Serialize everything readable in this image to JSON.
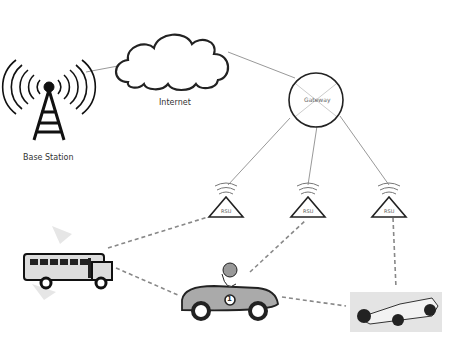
{
  "diagram": {
    "nodes": {
      "base_station": {
        "label": "Base Station"
      },
      "internet": {
        "label": "Internet"
      },
      "gateway": {
        "label": "Gateway"
      },
      "rsu": [
        {
          "label": "RSU"
        },
        {
          "label": "RSU"
        },
        {
          "label": "RSU"
        }
      ],
      "bus": {
        "label": ""
      },
      "race_car": {
        "label": "",
        "badge": "1"
      },
      "formula_car": {
        "label": ""
      }
    },
    "colors": {
      "line": "#999999",
      "dashed": "#888888",
      "outline": "#222222"
    }
  }
}
